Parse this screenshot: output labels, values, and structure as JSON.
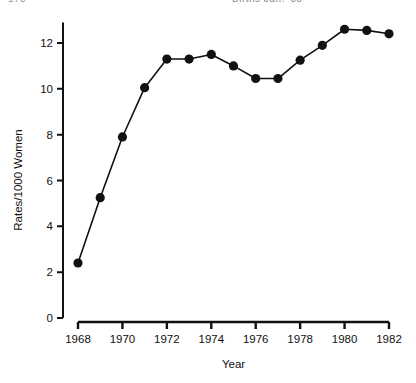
{
  "header": {
    "left_text": "178",
    "right_text": "Births  Jan.  '85"
  },
  "chart_data": {
    "type": "line",
    "title": "",
    "subtitle": "",
    "xlabel": "Year",
    "ylabel": "Rates/1000 Women",
    "x": [
      1968,
      1969,
      1970,
      1971,
      1972,
      1973,
      1974,
      1975,
      1976,
      1977,
      1978,
      1979,
      1980,
      1981,
      1982
    ],
    "values": [
      2.4,
      5.25,
      7.9,
      10.05,
      11.3,
      11.3,
      11.5,
      11.0,
      10.45,
      10.45,
      11.25,
      11.9,
      12.6,
      12.55,
      12.4
    ],
    "series": [
      {
        "name": "Rates/1000 Women",
        "values": [
          2.4,
          5.25,
          7.9,
          10.05,
          11.3,
          11.3,
          11.5,
          11.0,
          10.45,
          10.45,
          11.25,
          11.9,
          12.6,
          12.55,
          12.4
        ]
      }
    ],
    "xlim": [
      1968,
      1982
    ],
    "ylim": [
      0,
      12.9
    ],
    "xticks": [
      1968,
      1970,
      1972,
      1974,
      1976,
      1978,
      1980,
      1982
    ],
    "xticklabels": [
      "1968",
      "1970",
      "1972",
      "1974",
      "1976",
      "1978",
      "1980",
      "1982"
    ],
    "yticks": [
      0,
      2,
      4,
      6,
      8,
      10,
      12
    ],
    "yticklabels": [
      "0",
      "2",
      "4",
      "6",
      "8",
      "10",
      "12"
    ],
    "grid": false,
    "legend": "none",
    "marker": "filled-circle",
    "line_color": "#111111",
    "marker_color": "#111111",
    "background_color": "#ffffff"
  }
}
